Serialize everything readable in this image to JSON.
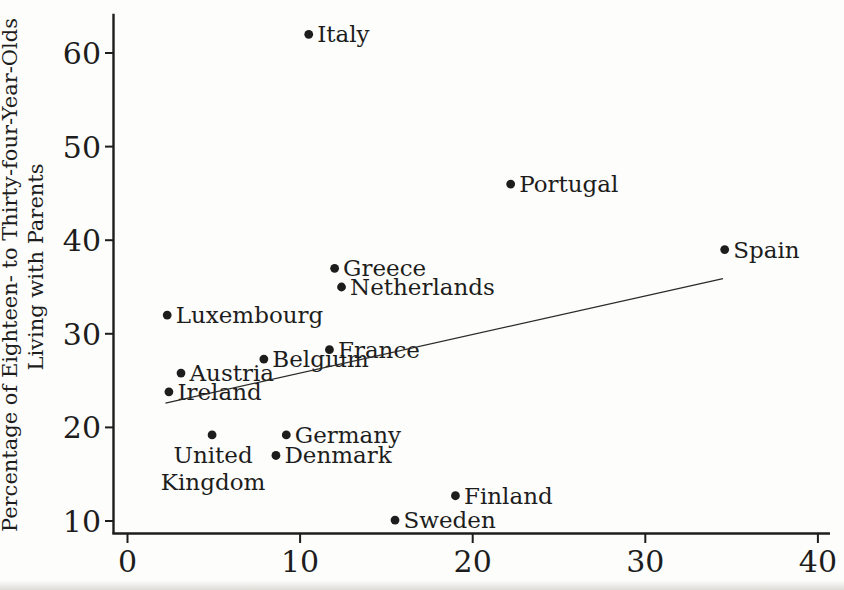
{
  "figure": {
    "background": "#fdfdfb",
    "ink_color": "#1d1d1d",
    "line_color": "#2a2a2a"
  },
  "chart_data": {
    "type": "scatter",
    "title": "",
    "xlabel": "",
    "ylabel_line1": "Percentage of Eighteen- to Thirty-four-Year-Olds",
    "ylabel_line2": "Living with Parents",
    "xlim": [
      -0.9,
      40.7
    ],
    "ylim": [
      8.7,
      64.2
    ],
    "x_ticks": [
      "0",
      "10",
      "20",
      "30",
      "40"
    ],
    "y_ticks": [
      "10",
      "20",
      "30",
      "40",
      "50",
      "60"
    ],
    "grid": false,
    "legend": "none",
    "points": [
      {
        "label": "Italy",
        "x": 10.5,
        "y": 62,
        "label_pos": "right"
      },
      {
        "label": "Portugal",
        "x": 22.2,
        "y": 46,
        "label_pos": "right"
      },
      {
        "label": "Spain",
        "x": 34.6,
        "y": 39,
        "label_pos": "right"
      },
      {
        "label": "Greece",
        "x": 12,
        "y": 37,
        "label_pos": "right"
      },
      {
        "label": "Netherlands",
        "x": 12.4,
        "y": 35,
        "label_pos": "right"
      },
      {
        "label": "Luxembourg",
        "x": 2.3,
        "y": 32,
        "label_pos": "right"
      },
      {
        "label": "France",
        "x": 11.7,
        "y": 28.3,
        "label_pos": "right"
      },
      {
        "label": "Belgium",
        "x": 7.9,
        "y": 27.3,
        "label_pos": "right"
      },
      {
        "label": "Austria",
        "x": 3.1,
        "y": 25.8,
        "label_pos": "right"
      },
      {
        "label": "Ireland",
        "x": 2.4,
        "y": 23.8,
        "label_pos": "right"
      },
      {
        "label": "United Kingdom",
        "x": 4.9,
        "y": 19.2,
        "label_pos": "below",
        "label_lines": [
          "United",
          "Kingdom"
        ]
      },
      {
        "label": "Germany",
        "x": 9.2,
        "y": 19.2,
        "label_pos": "right"
      },
      {
        "label": "Denmark",
        "x": 8.6,
        "y": 17,
        "label_pos": "right"
      },
      {
        "label": "Finland",
        "x": 19,
        "y": 12.7,
        "label_pos": "right"
      },
      {
        "label": "Sweden",
        "x": 15.5,
        "y": 10.1,
        "label_pos": "right"
      }
    ],
    "trendline": {
      "x1": 2.2,
      "y1": 22.6,
      "x2": 34.5,
      "y2": 35.9
    }
  }
}
